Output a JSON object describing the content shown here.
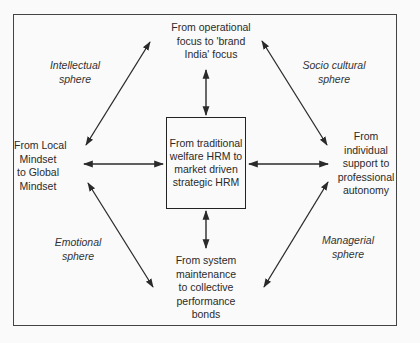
{
  "diagram": {
    "center": {
      "lines": [
        "From traditional",
        "welfare HRM to",
        "market driven",
        "strategic HRM"
      ]
    },
    "nodes": {
      "top": {
        "lines": [
          "From operational",
          "focus to 'brand",
          "India' focus"
        ]
      },
      "left": {
        "lines": [
          "From Local",
          "Mindset",
          "to Global",
          "Mindset"
        ]
      },
      "right": {
        "lines": [
          "From",
          "individual",
          "support to",
          "professional",
          "autonomy"
        ]
      },
      "bottom": {
        "lines": [
          "From system",
          "maintenance",
          "to collective",
          "performance",
          "bonds"
        ]
      }
    },
    "spheres": {
      "top_left": {
        "lines": [
          "Intellectual",
          "sphere"
        ]
      },
      "top_right": {
        "lines": [
          "Socio cultural",
          "sphere"
        ]
      },
      "bottom_left": {
        "lines": [
          "Emotional",
          "sphere"
        ]
      },
      "bottom_right": {
        "lines": [
          "Managerial",
          "sphere"
        ]
      }
    },
    "connections": [
      {
        "from": "top",
        "to": "center",
        "type": "double-arrow"
      },
      {
        "from": "left",
        "to": "center",
        "type": "double-arrow"
      },
      {
        "from": "right",
        "to": "center",
        "type": "double-arrow"
      },
      {
        "from": "bottom",
        "to": "center",
        "type": "double-arrow"
      },
      {
        "from": "top",
        "to": "left",
        "type": "double-arrow",
        "label": "Intellectual sphere"
      },
      {
        "from": "top",
        "to": "right",
        "type": "double-arrow",
        "label": "Socio cultural sphere"
      },
      {
        "from": "left",
        "to": "bottom",
        "type": "double-arrow",
        "label": "Emotional sphere"
      },
      {
        "from": "right",
        "to": "bottom",
        "type": "double-arrow",
        "label": "Managerial sphere"
      }
    ],
    "colors": {
      "line": "#2a2a2a",
      "background": "#fafafa"
    }
  }
}
